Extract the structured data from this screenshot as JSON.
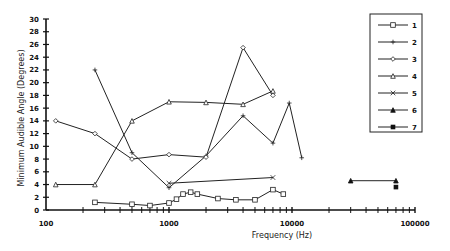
{
  "chart_data": {
    "type": "line",
    "title": "",
    "xlabel": "Frequency (Hz)",
    "ylabel": "Minimum Audible Angle (Degrees)",
    "xscale": "log",
    "xlim": [
      100,
      100000
    ],
    "ylim": [
      0,
      30
    ],
    "x_tick_labels": [
      "100",
      "1000",
      "10000",
      "100000"
    ],
    "y_tick_labels": [
      "0",
      "2",
      "4",
      "6",
      "8",
      "10",
      "12",
      "14",
      "16",
      "18",
      "20",
      "22",
      "24",
      "26",
      "28",
      "30"
    ],
    "grid": false,
    "legend_position": "upper right",
    "legend": [
      "1",
      "2",
      "3",
      "4",
      "5",
      "6",
      "7"
    ],
    "series": [
      {
        "name": "1",
        "marker": "square",
        "points": [
          [
            250,
            1.2
          ],
          [
            500,
            0.9
          ],
          [
            700,
            0.7
          ],
          [
            1000,
            1.1
          ],
          [
            1150,
            1.7
          ],
          [
            1300,
            2.5
          ],
          [
            1500,
            2.8
          ],
          [
            1700,
            2.5
          ],
          [
            2500,
            1.8
          ],
          [
            3500,
            1.6
          ],
          [
            5000,
            1.6
          ],
          [
            7000,
            3.2
          ],
          [
            8500,
            2.5
          ]
        ]
      },
      {
        "name": "2",
        "marker": "plus",
        "points": [
          [
            250,
            22
          ],
          [
            500,
            9
          ],
          [
            1000,
            3.5
          ],
          [
            2000,
            8.5
          ],
          [
            4000,
            14.8
          ],
          [
            7000,
            10.5
          ],
          [
            9500,
            16.8
          ],
          [
            12000,
            8.2
          ]
        ]
      },
      {
        "name": "3",
        "marker": "diamond",
        "points": [
          [
            120,
            14
          ],
          [
            250,
            12
          ],
          [
            500,
            8
          ],
          [
            1000,
            8.7
          ],
          [
            2000,
            8.3
          ],
          [
            4000,
            25.5
          ],
          [
            7000,
            18
          ]
        ]
      },
      {
        "name": "4",
        "marker": "triangle",
        "points": [
          [
            120,
            4
          ],
          [
            250,
            4
          ],
          [
            500,
            14
          ],
          [
            1000,
            17
          ],
          [
            2000,
            16.9
          ],
          [
            4000,
            16.6
          ],
          [
            7000,
            18.7
          ]
        ]
      },
      {
        "name": "5",
        "marker": "x",
        "points": [
          [
            1000,
            4.2
          ],
          [
            7000,
            5.1
          ]
        ]
      },
      {
        "name": "6",
        "marker": "filled-triangle",
        "points": [
          [
            30000,
            4.6
          ],
          [
            70000,
            4.6
          ]
        ]
      },
      {
        "name": "7",
        "marker": "filled-square",
        "points": [
          [
            70000,
            3.6
          ]
        ]
      }
    ]
  },
  "legend_title": "",
  "axes": {
    "x_title": "Frequency (Hz)",
    "y_title": "Minimum Audible Angle (Degrees)"
  }
}
